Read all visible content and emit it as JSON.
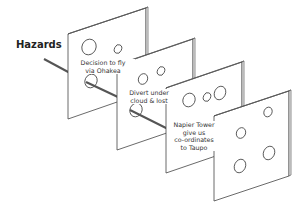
{
  "diagram": {
    "type": "swiss-cheese-model",
    "title": "Hazards",
    "slices": [
      {
        "label_line1": "Decision to fly",
        "label_line2": "via Ohakea",
        "label_line3": "",
        "label_line4": ""
      },
      {
        "label_line1": "Divert under",
        "label_line2": "cloud & lost",
        "label_line3": "",
        "label_line4": ""
      },
      {
        "label_line1": "Napier Tower",
        "label_line2": "give us",
        "label_line3": "co-ordinates",
        "label_line4": "to Taupo"
      },
      {
        "label_line1": "",
        "label_line2": "",
        "label_line3": "",
        "label_line4": ""
      }
    ],
    "colors": {
      "stroke": "#444444",
      "slice_fill": "#ffffff",
      "hazard_arrow": "#555555",
      "text": "#333333"
    }
  }
}
